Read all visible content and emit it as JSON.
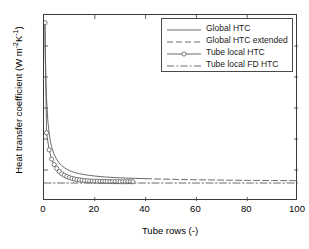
{
  "chart_data": {
    "type": "line",
    "title": "",
    "xlabel": "Tube rows (-)",
    "ylabel": "Heat transfer coefficient (W m-2K-1)",
    "ylabel_prefix": "Heat transfer coefficient (W m",
    "ylabel_sup1": "-2",
    "ylabel_mid": "K",
    "ylabel_sup2": "-1",
    "ylabel_suffix": ")",
    "xlim": [
      0,
      100
    ],
    "ylim": [
      20,
      140
    ],
    "xticks": [
      0,
      20,
      40,
      60,
      80,
      100
    ],
    "yticks": [
      20,
      40,
      60,
      80,
      100,
      120,
      140
    ],
    "xtick_labels": [
      "0",
      "20",
      "40",
      "60",
      "80",
      "100"
    ],
    "ytick_labels": [
      "20",
      "40",
      "60",
      "80",
      "100",
      "120",
      "140"
    ],
    "grid": false,
    "legend_position": "upper right",
    "line_color": "#5a5a5a",
    "axis_color": "#3a3a3a",
    "series": [
      {
        "name": "Global HTC",
        "style": "solid",
        "marker": "none",
        "x": [
          0.3,
          0.5,
          0.8,
          1,
          1.5,
          2,
          2.5,
          3,
          4,
          5,
          6,
          7,
          8,
          10,
          12,
          14,
          16,
          18,
          20,
          24,
          28,
          32,
          36,
          40
        ],
        "y": [
          135,
          112,
          95,
          86,
          72,
          64,
          58.5,
          55,
          50,
          46.8,
          44.5,
          42.8,
          41.5,
          39.6,
          38.4,
          37.6,
          37,
          36.5,
          36.1,
          35.5,
          35.1,
          34.8,
          34.6,
          34.4
        ]
      },
      {
        "name": "Global HTC extended",
        "style": "dashed",
        "marker": "none",
        "x": [
          40,
          50,
          60,
          70,
          80,
          90,
          100
        ],
        "y": [
          34.4,
          34.0,
          33.7,
          33.5,
          33.3,
          33.2,
          33.1
        ]
      },
      {
        "name": "Tube local HTC",
        "style": "solid",
        "marker": "circle",
        "x": [
          0.4,
          1,
          2,
          3,
          4,
          5,
          6,
          7,
          8,
          9,
          10,
          11,
          12,
          13,
          14,
          15,
          16,
          17,
          18,
          19,
          20,
          21,
          22,
          23,
          24,
          25,
          26,
          27,
          28,
          29,
          30,
          31,
          32,
          33,
          34,
          35
        ],
        "y": [
          135,
          64,
          53,
          47,
          43.5,
          41,
          39,
          37.6,
          36.6,
          35.8,
          35.1,
          34.6,
          34.2,
          33.9,
          33.6,
          33.4,
          33.2,
          33.05,
          32.95,
          32.85,
          32.78,
          32.72,
          32.67,
          32.63,
          32.6,
          32.57,
          32.54,
          32.52,
          32.5,
          32.48,
          32.46,
          32.45,
          32.44,
          32.43,
          32.42,
          32.41
        ]
      },
      {
        "name": "Tube local FD HTC",
        "style": "dashdot",
        "marker": "none",
        "x": [
          0,
          100
        ],
        "y": [
          31.6,
          31.6
        ]
      }
    ]
  },
  "legend": {
    "entries": [
      {
        "label": "Global HTC",
        "style": "solid",
        "marker": "none"
      },
      {
        "label": "Global HTC extended",
        "style": "dashed",
        "marker": "none"
      },
      {
        "label": "Tube local HTC",
        "style": "solid",
        "marker": "circle"
      },
      {
        "label": "Tube local FD HTC",
        "style": "dashdot",
        "marker": "none"
      }
    ]
  }
}
